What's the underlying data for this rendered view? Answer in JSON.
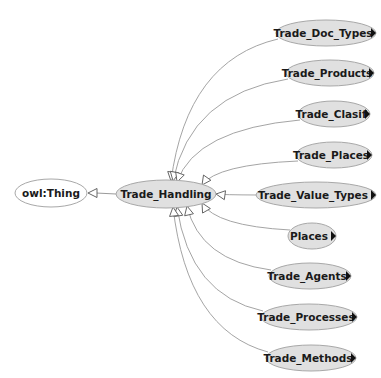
{
  "diagram": {
    "type": "ontology-class-graph",
    "colors": {
      "background": "#ffffff",
      "node_fill": "#e0e0e0",
      "node_stroke": "#a8a8a8",
      "root_fill": "#ffffff",
      "edge": "#9a9a9a",
      "text": "#1a1a1a",
      "expand_arrow": "#111111"
    },
    "root": {
      "id": "owl_thing",
      "label": "owl:Thing",
      "cx": 51,
      "cy": 193,
      "rx": 36,
      "ry": 14
    },
    "focus": {
      "id": "trade_handling",
      "label": "Trade_Handling",
      "cx": 166,
      "cy": 194,
      "rx": 50,
      "ry": 14
    },
    "children": [
      {
        "id": "trade_doc_types",
        "label": "Trade_Doc_Types",
        "cx": 326,
        "cy": 33,
        "rx": 50,
        "ry": 13,
        "expandable": true
      },
      {
        "id": "trade_products",
        "label": "Trade_Products",
        "cx": 330,
        "cy": 73,
        "rx": 44,
        "ry": 13,
        "expandable": true
      },
      {
        "id": "trade_clasif",
        "label": "Trade_Clasif",
        "cx": 334,
        "cy": 114,
        "rx": 36,
        "ry": 13,
        "expandable": true
      },
      {
        "id": "trade_places",
        "label": "Trade_Places",
        "cx": 334,
        "cy": 155,
        "rx": 38,
        "ry": 13,
        "expandable": true
      },
      {
        "id": "trade_value_types",
        "label": "Trade_Value_Types",
        "cx": 316,
        "cy": 195,
        "rx": 60,
        "ry": 13,
        "expandable": true
      },
      {
        "id": "places",
        "label": "Places",
        "cx": 312,
        "cy": 236,
        "rx": 24,
        "ry": 13,
        "expandable": true
      },
      {
        "id": "trade_agents",
        "label": "Trade_Agents",
        "cx": 310,
        "cy": 276,
        "rx": 41,
        "ry": 13,
        "expandable": true
      },
      {
        "id": "trade_processes",
        "label": "Trade_Processes",
        "cx": 309,
        "cy": 317,
        "rx": 48,
        "ry": 13,
        "expandable": true
      },
      {
        "id": "trade_methods",
        "label": "Trade_Methods",
        "cx": 311,
        "cy": 358,
        "rx": 45,
        "ry": 13,
        "expandable": true
      }
    ],
    "edges": [
      {
        "from": "trade_handling",
        "to": "owl_thing",
        "kind": "subclass-of"
      },
      {
        "from": "trade_doc_types",
        "to": "trade_handling",
        "kind": "subclass-of"
      },
      {
        "from": "trade_products",
        "to": "trade_handling",
        "kind": "subclass-of"
      },
      {
        "from": "trade_clasif",
        "to": "trade_handling",
        "kind": "subclass-of"
      },
      {
        "from": "trade_places",
        "to": "trade_handling",
        "kind": "subclass-of"
      },
      {
        "from": "trade_value_types",
        "to": "trade_handling",
        "kind": "subclass-of"
      },
      {
        "from": "places",
        "to": "trade_handling",
        "kind": "subclass-of"
      },
      {
        "from": "trade_agents",
        "to": "trade_handling",
        "kind": "subclass-of"
      },
      {
        "from": "trade_processes",
        "to": "trade_handling",
        "kind": "subclass-of"
      },
      {
        "from": "trade_methods",
        "to": "trade_handling",
        "kind": "subclass-of"
      }
    ],
    "icons": {
      "expand": "triangle-right-icon",
      "edge_head": "hollow-triangle-arrow-icon"
    }
  }
}
